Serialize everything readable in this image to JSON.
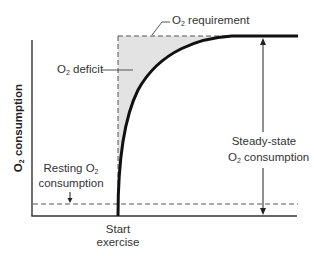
{
  "diagram": {
    "y_axis_label": {
      "prefix": "O",
      "sub": "2",
      "suffix": " consumption"
    },
    "labels": {
      "o2_requirement": {
        "prefix": "O",
        "sub": "2",
        "suffix": " requirement"
      },
      "o2_deficit": {
        "prefix": "O",
        "sub": "2",
        "suffix": " deficit"
      },
      "steady_state_line1": "Steady-state",
      "steady_state_line2": {
        "prefix": "O",
        "sub": "2",
        "suffix": " consumption"
      },
      "resting_line1": {
        "prefix": "Resting O",
        "sub": "2",
        "suffix": ""
      },
      "resting_line2": "consumption",
      "start_line1": "Start",
      "start_line2": "exercise"
    },
    "colors": {
      "curve": "#111111",
      "axis": "#333333",
      "dashed": "#555555",
      "deficit_fill": "#e3e3e3",
      "text": "#333333"
    }
  }
}
